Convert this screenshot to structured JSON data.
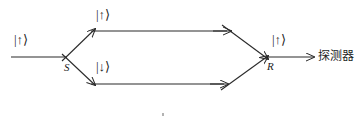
{
  "figure": {
    "type": "quantum-interferometer-diagram",
    "stroke_color": "#2a2a2a",
    "background_color": "#ffffff",
    "labels": {
      "input_ket": "|↑⟩",
      "upper_path_ket": "|↑⟩",
      "lower_path_ket": "|↓⟩",
      "output_ket": "|↑⟩",
      "splitter": "S",
      "recombiner": "R",
      "detector": "探测器"
    }
  }
}
